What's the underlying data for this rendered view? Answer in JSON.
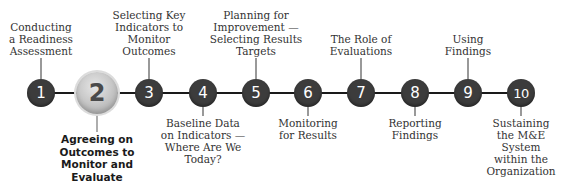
{
  "diagram": {
    "active_step": 2,
    "colors": {
      "node": "#3c3c3c",
      "node_text": "#ffffff",
      "active_node": "#c9c9c9",
      "active_node_text": "#4a4a4a",
      "connector": "#1a1a1a",
      "label_text": "#333333"
    },
    "steps": [
      {
        "number": "1",
        "label_lines": [
          "Conducting",
          "a Readiness",
          "Assessment"
        ],
        "position": "above"
      },
      {
        "number": "2",
        "label_lines": [
          "Agreeing on",
          "Outcomes to",
          "Monitor and",
          "Evaluate"
        ],
        "position": "below"
      },
      {
        "number": "3",
        "label_lines": [
          "Selecting Key",
          "Indicators to",
          "Monitor",
          "Outcomes"
        ],
        "position": "above"
      },
      {
        "number": "4",
        "label_lines": [
          "Baseline Data",
          "on Indicators —",
          "Where Are We",
          "Today?"
        ],
        "position": "below"
      },
      {
        "number": "5",
        "label_lines": [
          "Planning for",
          "Improvement —",
          "Selecting Results",
          "Targets"
        ],
        "position": "above"
      },
      {
        "number": "6",
        "label_lines": [
          "Monitoring",
          "for Results"
        ],
        "position": "below"
      },
      {
        "number": "7",
        "label_lines": [
          "The Role of",
          "Evaluations"
        ],
        "position": "above"
      },
      {
        "number": "8",
        "label_lines": [
          "Reporting",
          "Findings"
        ],
        "position": "below"
      },
      {
        "number": "9",
        "label_lines": [
          "Using",
          "Findings"
        ],
        "position": "above"
      },
      {
        "number": "10",
        "label_lines": [
          "Sustaining",
          "the M&E",
          "System",
          "within the",
          "Organization"
        ],
        "position": "below"
      }
    ]
  }
}
